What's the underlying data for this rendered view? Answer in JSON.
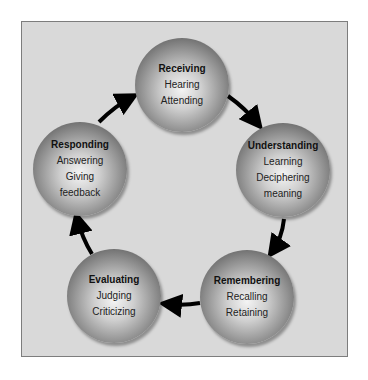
{
  "diagram": {
    "title": "",
    "nodes": [
      {
        "id": "receiving",
        "title": "Receiving",
        "lines": [
          "Hearing",
          "Attending"
        ]
      },
      {
        "id": "understanding",
        "title": "Understanding",
        "lines": [
          "Learning",
          "Deciphering",
          "meaning"
        ]
      },
      {
        "id": "remembering",
        "title": "Remembering",
        "lines": [
          "Recalling",
          "Retaining"
        ]
      },
      {
        "id": "evaluating",
        "title": "Evaluating",
        "lines": [
          "Judging",
          "Criticizing"
        ]
      },
      {
        "id": "responding",
        "title": "Responding",
        "lines": [
          "Answering",
          "Giving",
          "feedback"
        ]
      }
    ],
    "edges": [
      {
        "from": "receiving",
        "to": "understanding"
      },
      {
        "from": "understanding",
        "to": "remembering"
      },
      {
        "from": "remembering",
        "to": "evaluating"
      },
      {
        "from": "evaluating",
        "to": "responding"
      },
      {
        "from": "responding",
        "to": "receiving"
      }
    ],
    "colors": {
      "panel": "#d9d9d9",
      "border": "#7d7d7d",
      "arrow": "#000000"
    }
  }
}
